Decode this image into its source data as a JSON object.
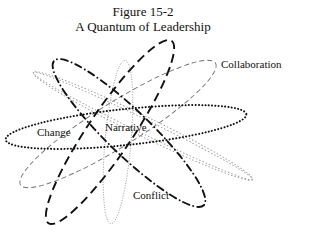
{
  "figure": {
    "number": "Figure 15-2",
    "title": "A Quantum of Leadership"
  },
  "labels": {
    "collaboration": "Collaboration",
    "change": "Change",
    "narrative": "Narrative",
    "conflict": "Conflict"
  },
  "ellipses": [
    {
      "name": "dotted-heavy",
      "style": "dotted",
      "weight": "heavy",
      "color": "#111111"
    },
    {
      "name": "long-dash-heavy",
      "style": "long-dash",
      "weight": "heavy",
      "color": "#111111"
    },
    {
      "name": "dash-dot-heavy",
      "style": "dash-dot",
      "weight": "heavy",
      "color": "#111111"
    },
    {
      "name": "dotted-light-vertical",
      "style": "dotted",
      "weight": "light",
      "color": "#888888"
    },
    {
      "name": "dashed-light",
      "style": "dashed",
      "weight": "light",
      "color": "#777777"
    },
    {
      "name": "double-dotted-light",
      "style": "double-dotted",
      "weight": "light",
      "color": "#999999"
    }
  ]
}
